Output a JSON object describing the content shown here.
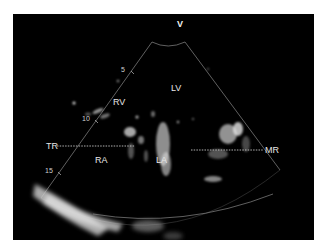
{
  "image": {
    "type": "echocardiogram",
    "view": "apical four-chamber",
    "orientation_marker": "V",
    "depth_markers": [
      "5",
      "10",
      "15"
    ],
    "chamber_labels": {
      "rv": "RV",
      "lv": "LV",
      "ra": "RA",
      "la": "LA"
    },
    "annotations": {
      "left": "TR",
      "right": "MR"
    },
    "colors": {
      "background": "#000000",
      "border": "#ffffff",
      "label": "#e6e6e6",
      "sector_line": "#9a9a9a"
    }
  }
}
